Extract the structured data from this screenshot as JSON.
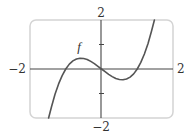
{
  "chart_data": {
    "type": "line",
    "title": "",
    "xlabel": "",
    "ylabel": "",
    "xlim": [
      -2,
      2
    ],
    "ylim": [
      -2,
      2
    ],
    "grid": false,
    "legend": null,
    "axis_labels": {
      "x_min": "−2",
      "x_max": "2",
      "y_min": "−2",
      "y_max": "2"
    },
    "y_ticks": [
      -1,
      1
    ],
    "annotations": [
      {
        "text": "f",
        "x": -0.6,
        "y": 0.9
      }
    ],
    "series": [
      {
        "name": "f",
        "x": [
          -1.48,
          -1.4,
          -1.3,
          -1.2,
          -1.1,
          -1.0,
          -0.9,
          -0.8,
          -0.7,
          -0.6,
          -0.5,
          -0.4,
          -0.3,
          -0.2,
          -0.1,
          0.0,
          0.1,
          0.2,
          0.3,
          0.4,
          0.5,
          0.6,
          0.7,
          0.8,
          0.9,
          1.0,
          1.1,
          1.2,
          1.3,
          1.4,
          1.48
        ],
        "y": [
          -2.0,
          -1.55,
          -1.03,
          -0.61,
          -0.27,
          0.0,
          0.2,
          0.33,
          0.41,
          0.44,
          0.43,
          0.39,
          0.31,
          0.22,
          0.11,
          0.0,
          -0.11,
          -0.22,
          -0.31,
          -0.39,
          -0.43,
          -0.44,
          -0.41,
          -0.33,
          -0.2,
          0.0,
          0.27,
          0.61,
          1.03,
          1.55,
          2.0
        ]
      }
    ],
    "colors": {
      "frame": "#d4d4d4",
      "axes": "#444444",
      "curve": "#555555",
      "text": "#333333"
    }
  }
}
